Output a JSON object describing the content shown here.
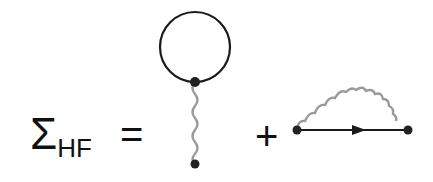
{
  "equation": {
    "lhs_symbol": "Σ",
    "lhs_subscript": "HF",
    "equals": "=",
    "plus": "+"
  },
  "diagrams": [
    {
      "name": "hartree-tadpole",
      "description": "fermion loop attached via wavy interaction line"
    },
    {
      "name": "fock-exchange",
      "description": "fermion propagator with arrow, wavy interaction arc"
    }
  ],
  "colors": {
    "line": "#1a1a1a",
    "wavy": "#9a9a9a",
    "vertex": "#222222"
  }
}
